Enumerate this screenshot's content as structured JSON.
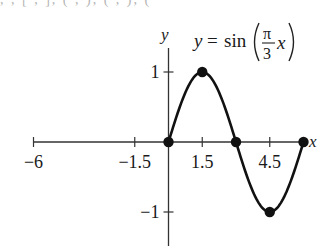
{
  "cut_text": "  ,  ,  [  ,  ],  (  ,  ),  (  ,  ),  (",
  "chart_data": {
    "type": "line",
    "title_parts": {
      "lhs": "y",
      "eq": "=",
      "fn": "sin",
      "num": "π",
      "den": "3",
      "var": "x"
    },
    "xlabel": "x",
    "ylabel": "y",
    "xlim": [
      -6,
      6
    ],
    "ylim": [
      -1.4,
      1.25
    ],
    "x_ticks": [
      -6,
      -1.5,
      1.5,
      4.5
    ],
    "x_tick_labels": [
      "−6",
      "−1.5",
      "1.5",
      "4.5"
    ],
    "x_minor_ticks": [
      -6,
      -1.5,
      1.5,
      4.5
    ],
    "y_ticks": [
      1,
      -1
    ],
    "y_tick_labels": [
      "1",
      "−1"
    ],
    "grid": false,
    "series": [
      {
        "name": "y = sin(πx/3)",
        "domain": [
          0,
          6
        ],
        "key_points": [
          {
            "x": 0,
            "y": 0
          },
          {
            "x": 1.5,
            "y": 1
          },
          {
            "x": 3,
            "y": 0
          },
          {
            "x": 4.5,
            "y": -1
          },
          {
            "x": 6,
            "y": 0
          }
        ]
      }
    ]
  }
}
